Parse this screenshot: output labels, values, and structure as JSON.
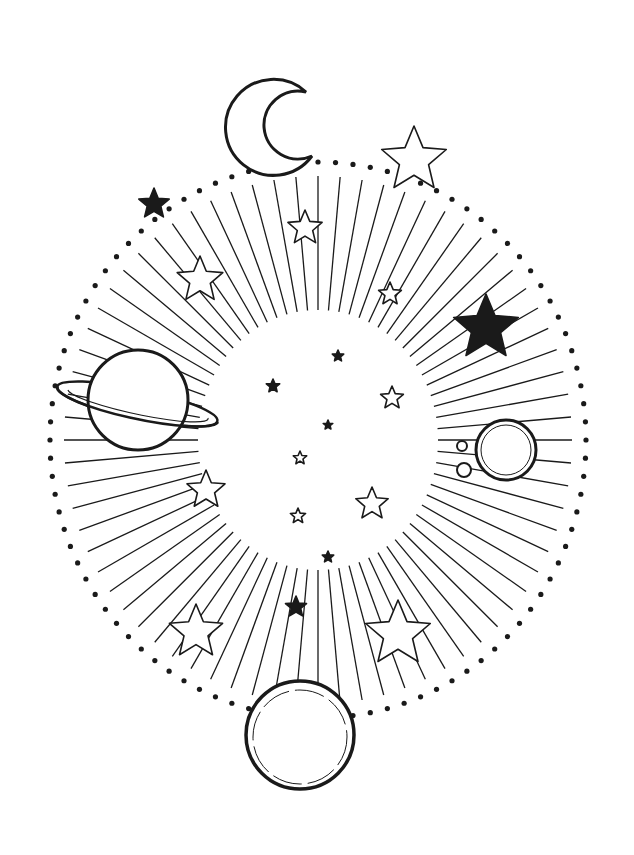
{
  "colors": {
    "ink": "#1a1a1a",
    "paper": "#ffffff"
  },
  "ellipse": {
    "cx": 318,
    "cy": 440,
    "rx": 268,
    "ry": 278,
    "dots": 96
  },
  "rays": {
    "count": 72,
    "inner_rx": 120,
    "inner_ry": 130
  },
  "moon": {
    "cx": 268,
    "cy": 122,
    "r": 48
  },
  "saturn": {
    "cx": 138,
    "cy": 400,
    "r": 50
  },
  "right_planet": {
    "cx": 506,
    "cy": 450,
    "r": 30
  },
  "bottom_planet": {
    "cx": 300,
    "cy": 735,
    "r": 54
  },
  "small_moons": [
    {
      "cx": 462,
      "cy": 446,
      "r": 5
    },
    {
      "cx": 464,
      "cy": 470,
      "r": 7
    }
  ],
  "stars": [
    {
      "x": 414,
      "y": 160,
      "r": 34,
      "fill": false
    },
    {
      "x": 154,
      "y": 204,
      "r": 16,
      "fill": true
    },
    {
      "x": 305,
      "y": 228,
      "r": 18,
      "fill": false
    },
    {
      "x": 200,
      "y": 280,
      "r": 24,
      "fill": false
    },
    {
      "x": 390,
      "y": 294,
      "r": 12,
      "fill": false
    },
    {
      "x": 486,
      "y": 328,
      "r": 34,
      "fill": true
    },
    {
      "x": 338,
      "y": 356,
      "r": 6,
      "fill": true
    },
    {
      "x": 273,
      "y": 386,
      "r": 7,
      "fill": true
    },
    {
      "x": 392,
      "y": 398,
      "r": 12,
      "fill": false
    },
    {
      "x": 328,
      "y": 425,
      "r": 5,
      "fill": true
    },
    {
      "x": 300,
      "y": 458,
      "r": 7,
      "fill": false
    },
    {
      "x": 206,
      "y": 490,
      "r": 20,
      "fill": false
    },
    {
      "x": 372,
      "y": 504,
      "r": 17,
      "fill": false
    },
    {
      "x": 298,
      "y": 516,
      "r": 8,
      "fill": false
    },
    {
      "x": 328,
      "y": 557,
      "r": 6,
      "fill": true
    },
    {
      "x": 296,
      "y": 607,
      "r": 11,
      "fill": true
    },
    {
      "x": 196,
      "y": 632,
      "r": 28,
      "fill": false
    },
    {
      "x": 398,
      "y": 634,
      "r": 34,
      "fill": false
    }
  ]
}
